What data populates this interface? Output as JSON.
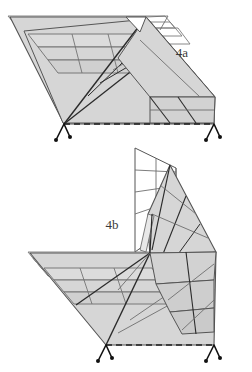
{
  "document": {
    "type": "technical-line-drawing",
    "background_color": "#ffffff",
    "width": 252,
    "height": 372
  },
  "palette": {
    "panel_fill": "#d6d6d6",
    "panel_fill_light": "#e4e4e4",
    "panel_fill_dark": "#c4c4c4",
    "outline": "#555555",
    "crease_line": "#2b2b2b",
    "thin_line": "#6e6e6e",
    "dashed_line": "#1f1f1f",
    "leg_color": "#111111",
    "label_color": "#3a3a3a"
  },
  "figures": [
    {
      "id": "figure-4a",
      "label": "4a",
      "label_x": 182,
      "label_y": 57,
      "description": "flat deployed folded-panel array, isometric view",
      "state": "flat",
      "support_legs": 2,
      "has_dashed_front_edge": true
    },
    {
      "id": "figure-4b",
      "label": "4b",
      "label_x": 112,
      "label_y": 229,
      "description": "partially folded panel array with raised vertical wing, isometric view",
      "state": "folded",
      "support_legs": 2,
      "has_dashed_front_edge": true
    }
  ],
  "legs": {
    "count_total": 4,
    "foot_dot_radius": 2.2
  }
}
